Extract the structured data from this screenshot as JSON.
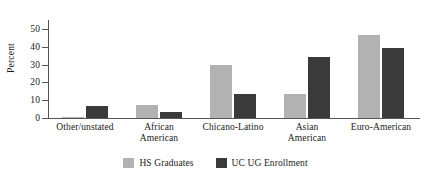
{
  "chart_data": {
    "type": "bar",
    "title": "",
    "subtitle": "",
    "xlabel": "",
    "ylabel": "Percent",
    "categories": [
      "Other/unstated",
      "African\nAmerican",
      "Chicano-Latino",
      "Asian\nAmerican",
      "Euro-American"
    ],
    "series": [
      {
        "name": "HS Graduates",
        "color": "#b2b2b2",
        "values": [
          0.7,
          7.5,
          29.6,
          13.5,
          46.5
        ]
      },
      {
        "name": "UC UG Enrollment",
        "color": "#3a3a3a",
        "values": [
          6.6,
          3.4,
          13.7,
          34.4,
          39.4
        ]
      }
    ],
    "ylim": [
      0,
      55
    ],
    "yticks": [
      0,
      10,
      20,
      30,
      40,
      50
    ],
    "ytick_labels": [
      "0",
      "10",
      "20",
      "30",
      "40",
      "50"
    ],
    "grid": false,
    "legend_position": "bottom"
  },
  "colors": {
    "axis": "#555555",
    "text": "#1a1a1a",
    "background": "#ffffff",
    "series_0": "#b2b2b2",
    "series_1": "#3a3a3a"
  }
}
